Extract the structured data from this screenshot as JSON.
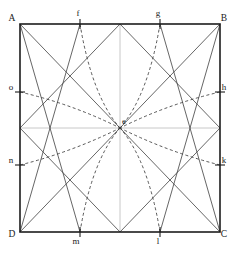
{
  "figure": {
    "title_remnant": "",
    "square": {
      "x0": 20,
      "y0": 24,
      "x1": 220,
      "y1": 232,
      "stroke": "#1d1d1d",
      "stroke_width": 1.6
    },
    "center": {
      "id": "e",
      "label": "e",
      "x": 120,
      "y": 128,
      "label_x": 124,
      "label_y": 124
    },
    "vertices": [
      {
        "id": "A",
        "label": "A",
        "x": 20,
        "y": 24,
        "label_x": 12,
        "label_y": 21
      },
      {
        "id": "B",
        "label": "B",
        "x": 220,
        "y": 24,
        "label_x": 224,
        "label_y": 21
      },
      {
        "id": "C",
        "label": "C",
        "x": 220,
        "y": 232,
        "label_x": 224,
        "label_y": 237
      },
      {
        "id": "D",
        "label": "D",
        "x": 20,
        "y": 232,
        "label_x": 12,
        "label_y": 237
      }
    ],
    "edge_points": [
      {
        "id": "f",
        "label": "f",
        "edge": "top",
        "x": 80,
        "y": 24,
        "label_x": 78,
        "label_y": 16
      },
      {
        "id": "g",
        "label": "g",
        "edge": "top",
        "x": 160,
        "y": 24,
        "label_x": 158,
        "label_y": 16
      },
      {
        "id": "h",
        "label": "h",
        "edge": "right",
        "x": 220,
        "y": 92,
        "label_x": 224,
        "label_y": 90
      },
      {
        "id": "k",
        "label": "k",
        "edge": "right",
        "x": 220,
        "y": 165,
        "label_x": 224,
        "label_y": 163
      },
      {
        "id": "l",
        "label": "l",
        "edge": "bottom",
        "x": 160,
        "y": 232,
        "label_x": 158,
        "label_y": 244
      },
      {
        "id": "m",
        "label": "m",
        "edge": "bottom",
        "x": 80,
        "y": 232,
        "label_x": 76,
        "label_y": 244
      },
      {
        "id": "n",
        "label": "n",
        "edge": "left",
        "x": 20,
        "y": 165,
        "label_x": 11,
        "label_y": 163
      },
      {
        "id": "o",
        "label": "o",
        "edge": "left",
        "x": 20,
        "y": 92,
        "label_x": 11,
        "label_y": 90
      }
    ],
    "quadrant_boxes": [
      {
        "id": "top-left",
        "x0": 20,
        "y0": 24,
        "x1": 120,
        "y1": 128
      },
      {
        "id": "top-right",
        "x0": 120,
        "y0": 24,
        "x1": 220,
        "y1": 128
      },
      {
        "id": "bottom-left",
        "x0": 20,
        "y0": 128,
        "x1": 120,
        "y1": 232
      },
      {
        "id": "bottom-right",
        "x0": 120,
        "y0": 128,
        "x1": 220,
        "y1": 232
      }
    ],
    "solid_lines": [
      {
        "id": "diag-A-e",
        "x1": 20,
        "y1": 24,
        "x2": 120,
        "y2": 128
      },
      {
        "id": "diag-B-e",
        "x1": 220,
        "y1": 24,
        "x2": 120,
        "y2": 128
      },
      {
        "id": "diag-C-e",
        "x1": 220,
        "y1": 232,
        "x2": 120,
        "y2": 128
      },
      {
        "id": "diag-D-e",
        "x1": 20,
        "y1": 232,
        "x2": 120,
        "y2": 128
      },
      {
        "id": "chord-A-m",
        "x1": 20,
        "y1": 24,
        "x2": 80,
        "y2": 232
      },
      {
        "id": "chord-f-D",
        "x1": 80,
        "y1": 24,
        "x2": 20,
        "y2": 232
      },
      {
        "id": "chord-g-C",
        "x1": 160,
        "y1": 24,
        "x2": 220,
        "y2": 232
      },
      {
        "id": "chord-B-l",
        "x1": 220,
        "y1": 24,
        "x2": 160,
        "y2": 232
      },
      {
        "id": "sub-tl-1",
        "x1": 20,
        "y1": 24,
        "x2": 120,
        "y2": 128
      },
      {
        "id": "sub-tl-2",
        "x1": 120,
        "y1": 24,
        "x2": 20,
        "y2": 128
      },
      {
        "id": "sub-tr-1",
        "x1": 120,
        "y1": 24,
        "x2": 220,
        "y2": 128
      },
      {
        "id": "sub-tr-2",
        "x1": 220,
        "y1": 24,
        "x2": 120,
        "y2": 128
      },
      {
        "id": "sub-bl-1",
        "x1": 20,
        "y1": 128,
        "x2": 120,
        "y2": 232
      },
      {
        "id": "sub-bl-2",
        "x1": 120,
        "y1": 128,
        "x2": 20,
        "y2": 232
      },
      {
        "id": "sub-br-1",
        "x1": 120,
        "y1": 128,
        "x2": 220,
        "y2": 232
      },
      {
        "id": "sub-br-2",
        "x1": 220,
        "y1": 128,
        "x2": 120,
        "y2": 232
      }
    ],
    "dashed_arcs": [
      {
        "id": "arc-f-e",
        "from": "f",
        "x1": 80,
        "y1": 24,
        "cx": 92,
        "cy": 96,
        "x2": 120,
        "y2": 128
      },
      {
        "id": "arc-g-e",
        "from": "g",
        "x1": 160,
        "y1": 24,
        "cx": 148,
        "cy": 96,
        "x2": 120,
        "y2": 128
      },
      {
        "id": "arc-h-e",
        "from": "h",
        "x1": 220,
        "y1": 92,
        "cx": 168,
        "cy": 104,
        "x2": 120,
        "y2": 128
      },
      {
        "id": "arc-k-e",
        "from": "k",
        "x1": 220,
        "y1": 165,
        "cx": 168,
        "cy": 152,
        "x2": 120,
        "y2": 128
      },
      {
        "id": "arc-l-e",
        "from": "l",
        "x1": 160,
        "y1": 232,
        "cx": 148,
        "cy": 160,
        "x2": 120,
        "y2": 128
      },
      {
        "id": "arc-m-e",
        "from": "m",
        "x1": 80,
        "y1": 232,
        "cx": 92,
        "cy": 160,
        "x2": 120,
        "y2": 128
      },
      {
        "id": "arc-n-e",
        "from": "n",
        "x1": 20,
        "y1": 165,
        "cx": 72,
        "cy": 152,
        "x2": 120,
        "y2": 128
      },
      {
        "id": "arc-o-e",
        "from": "o",
        "x1": 20,
        "y1": 92,
        "cx": 72,
        "cy": 104,
        "x2": 120,
        "y2": 128
      }
    ],
    "styles": {
      "outline_stroke": "#1d1d1d",
      "solid_stroke": "#4a4a4a",
      "dashed_stroke": "#3a3a3a",
      "dash_pattern": "3,2.5",
      "label_color": "#1a1a1a",
      "background": "#ffffff"
    }
  }
}
